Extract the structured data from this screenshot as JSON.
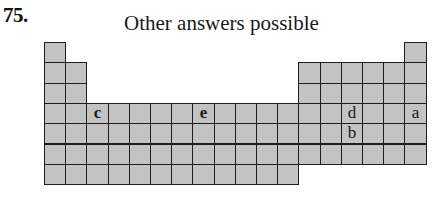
{
  "header": {
    "problem_number": "75.",
    "caption": "Other answers possible"
  },
  "periodic_table": {
    "columns": 18,
    "rows": 7,
    "origin_x": 44,
    "origin_y": 42,
    "cell_width": 21.2,
    "cell_height": 20.3,
    "fill_color": "#c3c3c3",
    "border_color": "#1e1e1e",
    "row_layout": [
      {
        "row": 1,
        "columns": [
          1,
          18
        ]
      },
      {
        "row": 2,
        "columns": [
          1,
          2,
          13,
          14,
          15,
          16,
          17,
          18
        ]
      },
      {
        "row": 3,
        "columns": [
          1,
          2,
          13,
          14,
          15,
          16,
          17,
          18
        ]
      },
      {
        "row": 4,
        "columns": [
          1,
          2,
          3,
          4,
          5,
          6,
          7,
          8,
          9,
          10,
          11,
          12,
          13,
          14,
          15,
          16,
          17,
          18
        ]
      },
      {
        "row": 5,
        "columns": [
          1,
          2,
          3,
          4,
          5,
          6,
          7,
          8,
          9,
          10,
          11,
          12,
          13,
          14,
          15,
          16,
          17,
          18
        ]
      },
      {
        "row": 6,
        "columns": [
          1,
          2,
          3,
          4,
          5,
          6,
          7,
          8,
          9,
          10,
          11,
          12,
          13,
          14,
          15,
          16,
          17,
          18
        ]
      },
      {
        "row": 7,
        "columns": [
          1,
          2,
          3,
          4,
          5,
          6,
          7,
          8,
          9,
          10,
          11,
          12
        ]
      }
    ],
    "labels": [
      {
        "text": "c",
        "row": 4,
        "column": 3,
        "bold": true
      },
      {
        "text": "e",
        "row": 4,
        "column": 8,
        "bold": true
      },
      {
        "text": "d",
        "row": 4,
        "column": 15,
        "bold": false
      },
      {
        "text": "b",
        "row": 5,
        "column": 15,
        "bold": false
      },
      {
        "text": "a",
        "row": 4,
        "column": 18,
        "bold": false
      }
    ]
  }
}
